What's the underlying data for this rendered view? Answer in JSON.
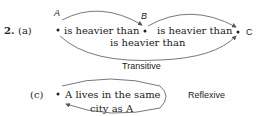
{
  "problem": {
    "number": "2.",
    "parts": [
      {
        "label": "(a)",
        "nodes": [
          "A",
          "B",
          "C"
        ],
        "edges": [
          {
            "from": "A",
            "to": "B",
            "label": "is heavier than"
          },
          {
            "from": "B",
            "to": "C",
            "label": "is heavier than"
          },
          {
            "from": "A",
            "to": "C",
            "label": "is heavier than"
          }
        ],
        "property": "Transitive"
      },
      {
        "label": "(c)",
        "text_line1": "A lives in the same",
        "text_line2": "city as A",
        "property": "Reflexive"
      }
    ]
  }
}
